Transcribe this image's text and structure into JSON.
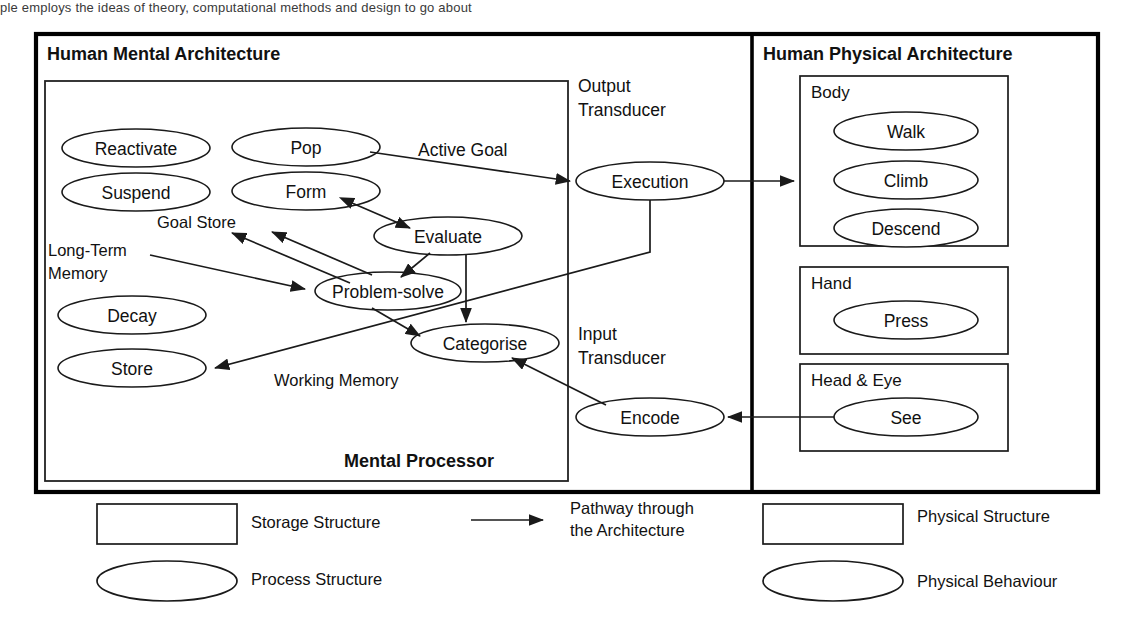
{
  "page": {
    "top_partial_text": "ple employs the ideas of theory, computational methods and design to go about"
  },
  "mental": {
    "title": "Human Mental Architecture",
    "processor_label": "Mental Processor",
    "regions": [
      {
        "name": "goal-store",
        "label": "Goal Store"
      },
      {
        "name": "long-term-memory",
        "label": "Long-Term\nMemory",
        "line1": "Long-Term",
        "line2": "Memory"
      },
      {
        "name": "working-memory",
        "label": "Working Memory"
      }
    ],
    "processes": [
      {
        "id": "reactivate",
        "label": "Reactivate"
      },
      {
        "id": "suspend",
        "label": "Suspend"
      },
      {
        "id": "pop",
        "label": "Pop"
      },
      {
        "id": "form",
        "label": "Form"
      },
      {
        "id": "evaluate",
        "label": "Evaluate"
      },
      {
        "id": "problem-solve",
        "label": "Problem-solve"
      },
      {
        "id": "decay",
        "label": "Decay"
      },
      {
        "id": "store",
        "label": "Store"
      },
      {
        "id": "categorise",
        "label": "Categorise"
      }
    ],
    "pathway_labels": [
      {
        "id": "active-goal",
        "label": "Active Goal"
      }
    ]
  },
  "transducers": {
    "output": {
      "line1": "Output",
      "line2": "Transducer",
      "process": "Execution"
    },
    "input": {
      "line1": "Input",
      "line2": "Transducer",
      "process": "Encode"
    }
  },
  "physical": {
    "title": "Human Physical Architecture",
    "structures": [
      {
        "id": "body",
        "label": "Body",
        "behaviours": [
          "Walk",
          "Climb",
          "Descend"
        ]
      },
      {
        "id": "hand",
        "label": "Hand",
        "behaviours": [
          "Press"
        ]
      },
      {
        "id": "head-eye",
        "label": "Head & Eye",
        "behaviours": [
          "See"
        ]
      }
    ]
  },
  "legend": {
    "items": [
      {
        "id": "storage-structure",
        "shape": "rectangle",
        "label": "Storage Structure"
      },
      {
        "id": "process-structure",
        "shape": "ellipse",
        "label": "Process Structure"
      },
      {
        "id": "pathway",
        "shape": "arrow",
        "line1": "Pathway through",
        "line2": "the Architecture"
      },
      {
        "id": "physical-structure",
        "shape": "rectangle",
        "label": "Physical Structure"
      },
      {
        "id": "physical-behaviour",
        "shape": "ellipse",
        "label": "Physical Behaviour"
      }
    ]
  },
  "colors": {
    "stroke": "#1a1a1a",
    "outer_stroke": "#000000",
    "background": "#ffffff"
  }
}
